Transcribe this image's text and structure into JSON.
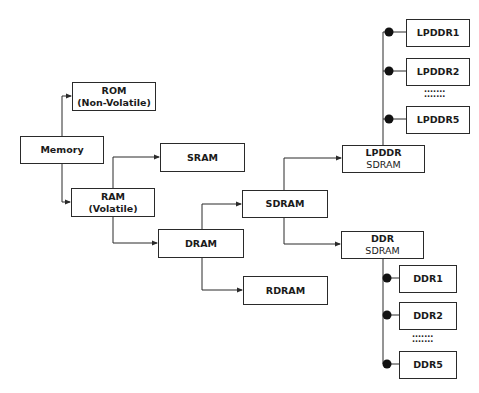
{
  "diagram": {
    "nodes": {
      "memory": {
        "line1": "Memory"
      },
      "rom": {
        "line1": "ROM",
        "line2": "(Non-Volatile)"
      },
      "ram": {
        "line1": "RAM",
        "line2": "(Volatile)"
      },
      "sram": {
        "line1": "SRAM"
      },
      "dram": {
        "line1": "DRAM"
      },
      "sdram": {
        "line1": "SDRAM"
      },
      "rdram": {
        "line1": "RDRAM"
      },
      "lpddr": {
        "line1": "LPDDR",
        "line2": "SDRAM"
      },
      "ddr": {
        "line1": "DDR",
        "line2": "SDRAM"
      },
      "lpddr1": {
        "line1": "LPDDR1"
      },
      "lpddr2": {
        "line1": "LPDDR2"
      },
      "lpddr5": {
        "line1": "LPDDR5"
      },
      "ddr1": {
        "line1": "DDR1"
      },
      "ddr2": {
        "line1": "DDR2"
      },
      "ddr5": {
        "line1": "DDR5"
      }
    },
    "ellipsis": "·······\n·······",
    "edges": [
      [
        "Memory",
        "ROM"
      ],
      [
        "Memory",
        "RAM"
      ],
      [
        "RAM",
        "SRAM"
      ],
      [
        "RAM",
        "DRAM"
      ],
      [
        "DRAM",
        "SDRAM"
      ],
      [
        "DRAM",
        "RDRAM"
      ],
      [
        "SDRAM",
        "LPDDR SDRAM"
      ],
      [
        "SDRAM",
        "DDR SDRAM"
      ],
      [
        "LPDDR SDRAM",
        "LPDDR1"
      ],
      [
        "LPDDR SDRAM",
        "LPDDR2"
      ],
      [
        "LPDDR SDRAM",
        "LPDDR5"
      ],
      [
        "DDR SDRAM",
        "DDR1"
      ],
      [
        "DDR SDRAM",
        "DDR2"
      ],
      [
        "DDR SDRAM",
        "DDR5"
      ]
    ],
    "colors": {
      "line": "#2a2a2a",
      "background": "#ffffff"
    }
  }
}
